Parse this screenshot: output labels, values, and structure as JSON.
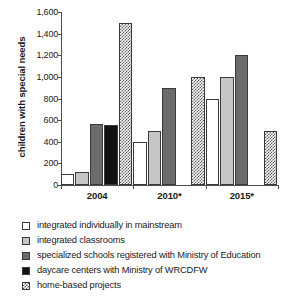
{
  "chart_data": {
    "type": "bar",
    "title": "",
    "subtitle": "",
    "xlabel": "",
    "ylabel": "children with special needs",
    "categories": [
      "2004",
      "2010*",
      "2015*"
    ],
    "ylim": [
      0,
      1600
    ],
    "yticks": [
      0,
      200,
      400,
      600,
      800,
      1000,
      1200,
      1400,
      1600
    ],
    "ytick_labels": [
      "0",
      "200",
      "400",
      "600",
      "800",
      "1,000",
      "1,200",
      "1,400",
      "1,600"
    ],
    "grid": false,
    "legend_position": "below",
    "series": [
      {
        "name": "integrated individually in mainstream",
        "swatch": "white",
        "color": "#ffffff",
        "values": [
          100,
          400,
          800
        ]
      },
      {
        "name": "integrated classrooms",
        "swatch": "light-gray",
        "color": "#c6c6c6",
        "values": [
          120,
          500,
          1000
        ]
      },
      {
        "name": "specialized schools registered with Ministry of Education",
        "swatch": "dark-gray",
        "color": "#6b6b6b",
        "values": [
          560,
          900,
          1200
        ]
      },
      {
        "name": "daycare centers with Ministry of WRCDFW",
        "swatch": "black",
        "color": "#121212",
        "values": [
          555,
          null,
          null
        ]
      },
      {
        "name": "home-based projects",
        "swatch": "checker",
        "color": "#5f5f5f",
        "values": [
          1500,
          1000,
          500
        ]
      }
    ]
  },
  "legend": {
    "items": [
      {
        "label": "integrated individually in mainstream",
        "swatch": "white"
      },
      {
        "label": "integrated classrooms",
        "swatch": "light-gray"
      },
      {
        "label": "specialized schools registered with Ministry of Education",
        "swatch": "dark-gray"
      },
      {
        "label": "daycare centers with Ministry of WRCDFW",
        "swatch": "black"
      },
      {
        "label": "home-based projects",
        "swatch": "checker"
      }
    ]
  }
}
